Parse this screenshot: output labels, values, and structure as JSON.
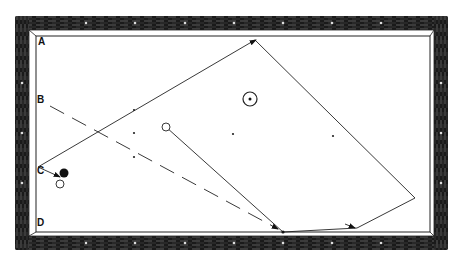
{
  "diagram": {
    "colors": {
      "frame": "#1a1a1a",
      "cloth": "#ffffff",
      "line": "#222222",
      "ball_dark": "#111111"
    },
    "labels": [
      {
        "id": "A",
        "text": "A",
        "x": 38,
        "y": 38
      },
      {
        "id": "B",
        "text": "B",
        "x": 37,
        "y": 95
      },
      {
        "id": "C",
        "text": "C",
        "x": 37,
        "y": 166
      },
      {
        "id": "D",
        "text": "D",
        "x": 37,
        "y": 218
      }
    ],
    "table": {
      "outer": {
        "x": 15,
        "y": 16,
        "w": 433,
        "h": 234
      },
      "inner": {
        "x": 36,
        "y": 36,
        "w": 394,
        "h": 196
      }
    },
    "balls": [
      {
        "name": "black-ball",
        "x": 64,
        "y": 173,
        "r": 4.5,
        "fill": "dark"
      },
      {
        "name": "white-ball-near-c",
        "x": 60,
        "y": 184,
        "r": 4,
        "fill": "open"
      },
      {
        "name": "cue-ball",
        "x": 166,
        "y": 127,
        "r": 4,
        "fill": "open"
      },
      {
        "name": "target-ball-dotted",
        "x": 250,
        "y": 99,
        "r": 7,
        "fill": "ring-dot"
      }
    ],
    "diamond_markers": [
      {
        "x": 134,
        "y": 110
      },
      {
        "x": 134,
        "y": 133
      },
      {
        "x": 134,
        "y": 157
      },
      {
        "x": 233,
        "y": 134
      },
      {
        "x": 333,
        "y": 136
      }
    ],
    "solid_path": [
      [
        166,
        127
      ],
      [
        283,
        232
      ],
      [
        357,
        228
      ],
      [
        415,
        198
      ],
      [
        255,
        40
      ],
      [
        38,
        167
      ],
      [
        58,
        177
      ]
    ],
    "dashed_path": [
      [
        50,
        106
      ],
      [
        278,
        229
      ]
    ]
  }
}
